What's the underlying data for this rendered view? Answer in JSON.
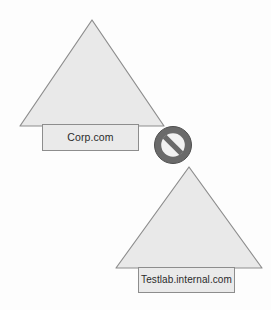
{
  "diagram": {
    "canvas": {
      "width": 271,
      "height": 310,
      "background": "#fdfdfd"
    },
    "colors": {
      "shape_fill": "#e9e9e9",
      "shape_stroke": "#8d8d8d",
      "label_fill": "#eaeaea",
      "label_stroke": "#8d8d8d",
      "label_text": "#2b2b2b",
      "block_icon": "#6a6a6a",
      "block_icon_inner": "#f2f2f2"
    },
    "nodes": [
      {
        "id": "corp",
        "shape": "triangle",
        "label": "Corp.com",
        "icon_name": "domain-triangle-icon",
        "apex": {
          "x": 92,
          "y": 20
        },
        "base_left": {
          "x": 20,
          "y": 126
        },
        "base_right": {
          "x": 164,
          "y": 126
        }
      },
      {
        "id": "testlab",
        "shape": "triangle",
        "label": "Testlab.internal.com",
        "icon_name": "domain-triangle-icon",
        "apex": {
          "x": 189,
          "y": 167
        },
        "base_left": {
          "x": 116,
          "y": 268
        },
        "base_right": {
          "x": 262,
          "y": 268
        }
      }
    ],
    "connector": {
      "id": "blocked",
      "icon_name": "no-entry-icon",
      "state_label": "Blocked",
      "center": {
        "x": 173,
        "y": 145
      },
      "diameter": 37
    }
  }
}
